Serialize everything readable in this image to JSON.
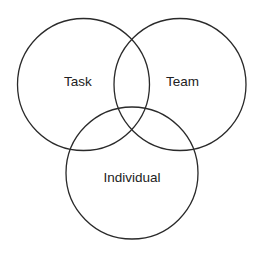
{
  "diagram": {
    "type": "venn",
    "sets": [
      {
        "id": "task",
        "label": "Task"
      },
      {
        "id": "team",
        "label": "Team"
      },
      {
        "id": "individual",
        "label": "Individual"
      }
    ],
    "line_color": "#2a2a2a",
    "text_color": "#222222",
    "background": "#ffffff"
  }
}
